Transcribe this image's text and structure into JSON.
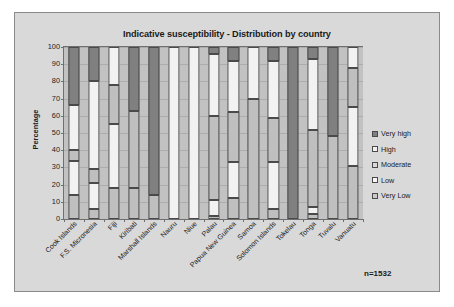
{
  "chart_data": {
    "type": "bar",
    "subtype": "stacked-100-percent",
    "title": "Indicative susceptibility - Distribution by country",
    "xlabel": "",
    "ylabel": "Percentage",
    "ylim": [
      0,
      100
    ],
    "ytick_labels": [
      "0",
      "10",
      "20",
      "30",
      "40",
      "50",
      "60",
      "70",
      "80",
      "90",
      "100"
    ],
    "ytick_values": [
      0,
      10,
      20,
      30,
      40,
      50,
      60,
      70,
      80,
      90,
      100
    ],
    "grid": true,
    "legend_position": "right",
    "annotation": "n=1532",
    "categories": [
      "Cook Islands",
      "F.S. Micronesia",
      "Fiji",
      "Kiribati",
      "Marshall Islands",
      "Nauru",
      "Niue",
      "Palau",
      "Papua New Guinea",
      "Samoa",
      "Solomon Islands",
      "Tokelau",
      "Tonga",
      "Tuvalu",
      "Vanuatu"
    ],
    "series": [
      {
        "name": "Very high",
        "color": "#808080",
        "values": [
          34,
          20,
          0,
          37,
          86,
          0,
          0,
          4,
          8,
          0,
          8,
          100,
          7,
          52,
          0
        ]
      },
      {
        "name": "High",
        "color": "#f2f2f2",
        "values": [
          26,
          51,
          22,
          0,
          0,
          100,
          100,
          36,
          30,
          30,
          33,
          0,
          41,
          0,
          12
        ]
      },
      {
        "name": "Moderate",
        "color": "#bfbfbf",
        "values": [
          6.5,
          8,
          22.5,
          45,
          0,
          0,
          0,
          49,
          29,
          70,
          26,
          0,
          45,
          48,
          23
        ]
      },
      {
        "name": "Low",
        "color": "#f2f2f2",
        "values": [
          19.5,
          15,
          37.5,
          0,
          0,
          0,
          0,
          9,
          21,
          0,
          27,
          0,
          4,
          0,
          34
        ]
      },
      {
        "name": "Very Low",
        "color": "#bfbfbf",
        "values": [
          14,
          6,
          18,
          18,
          14,
          0,
          0,
          2,
          12,
          0,
          6,
          0,
          3,
          0,
          31
        ]
      }
    ],
    "legend_entries": [
      {
        "label": "Very high",
        "color": "#808080"
      },
      {
        "label": "High",
        "color": "#f2f2f2"
      },
      {
        "label": "Moderate",
        "color": "#d9d9d9"
      },
      {
        "label": "Low",
        "color": "#f7f7f7"
      },
      {
        "label": "Very Low",
        "color": "#c9c9c9"
      }
    ]
  }
}
